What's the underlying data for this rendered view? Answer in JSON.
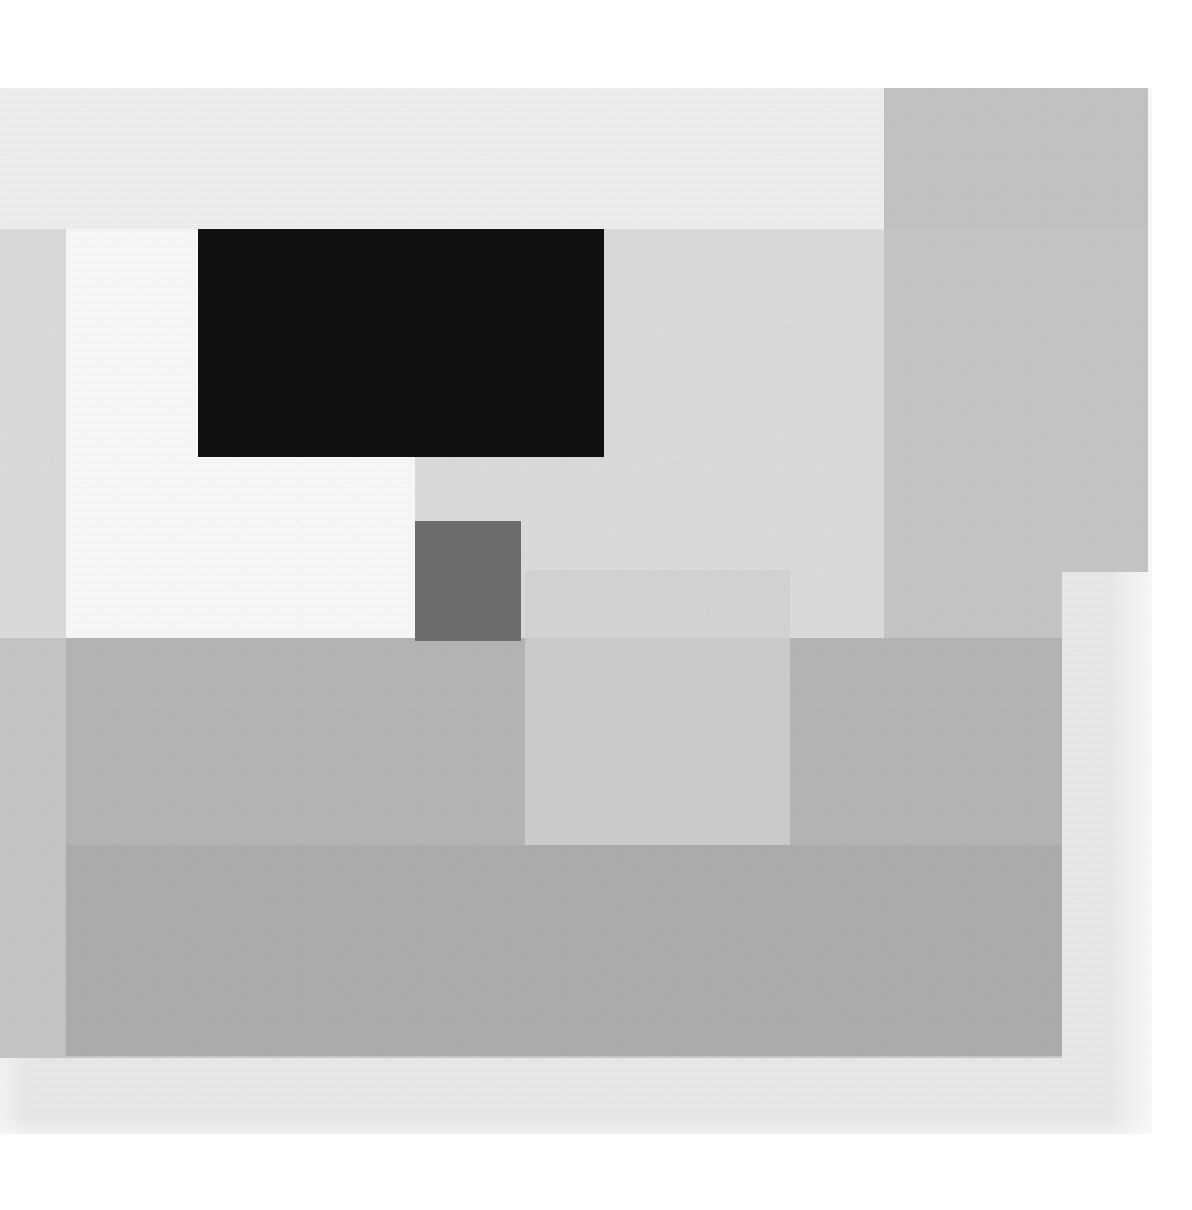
{
  "artwork": {
    "title": "Untitled Geometric Composition",
    "medium": "Greyscale overlapping rectangles on canvas",
    "orientation": "landscape",
    "page_background": "#ffffff",
    "canvas": {
      "x": 0,
      "y": 88,
      "width": 1152,
      "height": 1046,
      "ground_color": "#e9e9e9",
      "texture": "woven-canvas-weave"
    },
    "palette": {
      "paper_white": "#ffffff",
      "canvas_ground": "#e9e9e9",
      "near_white_block": "#f7f7f7",
      "top_band_light": "#eeeeee",
      "pale_grey": "#dddddd",
      "mid_grey": "#c6c6c6",
      "translucent_square": "#cfcfcf",
      "body_grey": "#b5b5b5",
      "lower_band_grey": "#aeaeae",
      "dark_grey_square": "#6e6e6e",
      "black_rectangle": "#111111"
    },
    "shapes": [
      {
        "id": "top-light-band",
        "name": "top-light-band",
        "label": "Upper pale horizontal band",
        "color": "#efefef",
        "x": 0,
        "y": 88,
        "width": 884,
        "height": 141,
        "opacity": 1
      },
      {
        "id": "right-mid-grey-field",
        "name": "right-mid-grey-field",
        "label": "Right-hand mid grey field",
        "color": "#c3c3c3",
        "x": 884,
        "y": 88,
        "width": 264,
        "height": 484,
        "opacity": 1
      },
      {
        "id": "mid-grey-band",
        "name": "mid-grey-band",
        "label": "Central mid grey band",
        "color": "#c6c6c6",
        "x": 0,
        "y": 229,
        "width": 1148,
        "height": 343,
        "opacity": 1
      },
      {
        "id": "mid-grey-lower-right",
        "name": "mid-grey-lower-right",
        "label": "Mid grey field lower right step",
        "color": "#c6c6c6",
        "x": 0,
        "y": 572,
        "width": 1062,
        "height": 486,
        "opacity": 1
      },
      {
        "id": "pale-grey-interior",
        "name": "pale-grey-interior",
        "label": "Pale grey interior panel",
        "color": "#dcdcdc",
        "x": 0,
        "y": 229,
        "width": 884,
        "height": 409,
        "opacity": 1
      },
      {
        "id": "white-block",
        "name": "white-block",
        "label": "Near-white rectangle, upper left",
        "color": "#f8f8f8",
        "x": 66,
        "y": 229,
        "width": 349,
        "height": 409,
        "opacity": 1
      },
      {
        "id": "black-rectangle",
        "name": "black-rectangle",
        "label": "Black rectangle",
        "color": "#101010",
        "x": 198,
        "y": 229,
        "width": 406,
        "height": 228,
        "opacity": 1
      },
      {
        "id": "dark-grey-square",
        "name": "dark-grey-square",
        "label": "Small dark grey square",
        "color": "#6e6e6e",
        "x": 415,
        "y": 521,
        "width": 106,
        "height": 120,
        "opacity": 1
      },
      {
        "id": "body-grey-block",
        "name": "body-grey-block",
        "label": "Large grey block, lower half",
        "color": "#b5b5b5",
        "x": 66,
        "y": 638,
        "width": 996,
        "height": 418,
        "opacity": 1
      },
      {
        "id": "lower-grey-band",
        "name": "lower-grey-band",
        "label": "Slightly darker lower grey band",
        "color": "#adadad",
        "x": 66,
        "y": 845,
        "width": 996,
        "height": 211,
        "opacity": 1
      },
      {
        "id": "translucent-square",
        "name": "translucent-square",
        "label": "Translucent pale square overlay",
        "color": "#d2d2d2",
        "x": 525,
        "y": 570,
        "width": 265,
        "height": 275,
        "opacity": 0.82
      }
    ],
    "counts": {
      "shape_count": "11",
      "distinct_tones": "9"
    }
  }
}
